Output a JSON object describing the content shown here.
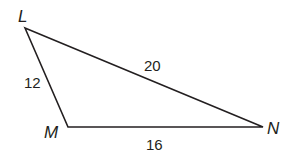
{
  "diagram": {
    "type": "triangle",
    "vertices": [
      {
        "name": "L",
        "x": 25,
        "y": 28
      },
      {
        "name": "M",
        "x": 68,
        "y": 127
      },
      {
        "name": "N",
        "x": 263,
        "y": 127
      }
    ],
    "sides": [
      {
        "from": "L",
        "to": "M",
        "label": "12"
      },
      {
        "from": "L",
        "to": "N",
        "label": "20"
      },
      {
        "from": "M",
        "to": "N",
        "label": "16"
      }
    ],
    "line_color": "#231f20"
  }
}
